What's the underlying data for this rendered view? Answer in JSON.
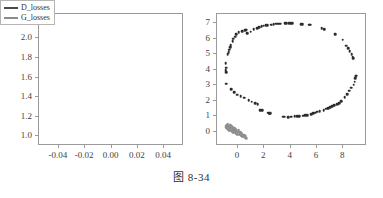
{
  "caption": "图 8-34",
  "legend": {
    "position": "upper right",
    "entries": [
      {
        "label": "D_losses",
        "color": "#4a4a4a"
      },
      {
        "label": "G_losses",
        "color": "#8c8c8c"
      }
    ]
  },
  "chart_data": [
    {
      "type": "line",
      "id": "loss-curves",
      "title": "",
      "xlabel": "",
      "ylabel": "",
      "xlim": [
        -0.055,
        0.055
      ],
      "ylim": [
        0.9,
        2.25
      ],
      "xticks": [
        "-0.04",
        "-0.02",
        "0.00",
        "0.02",
        "0.04"
      ],
      "xtick_values": [
        -0.04,
        -0.02,
        0.0,
        0.02,
        0.04
      ],
      "yticks": [
        "1.0",
        "1.2",
        "1.4",
        "1.6",
        "1.8",
        "2.0",
        "2.2"
      ],
      "ytick_values": [
        1.0,
        1.2,
        1.4,
        1.6,
        1.8,
        2.0,
        2.2
      ],
      "grid": false,
      "legend_position": "upper right",
      "series": [
        {
          "name": "D_losses",
          "color": "#4a4a4a",
          "x": [],
          "values": []
        },
        {
          "name": "G_losses",
          "color": "#8c8c8c",
          "x": [],
          "values": []
        }
      ]
    },
    {
      "type": "scatter",
      "id": "samples-scatter",
      "title": "",
      "xlabel": "",
      "ylabel": "",
      "xlim": [
        -1.6,
        9.8
      ],
      "ylim": [
        -0.9,
        7.6
      ],
      "xticks": [
        "0",
        "2",
        "4",
        "6",
        "8"
      ],
      "xtick_values": [
        0,
        2,
        4,
        6,
        8
      ],
      "yticks": [
        "0",
        "1",
        "2",
        "3",
        "4",
        "5",
        "6",
        "7"
      ],
      "ytick_values": [
        0,
        1,
        2,
        3,
        4,
        5,
        6,
        7
      ],
      "grid": false,
      "series": [
        {
          "name": "real-ring",
          "color": "#2b2b2b",
          "marker_size": 2.6,
          "points": [
            [
              -0.95,
              4.45
            ],
            [
              -0.92,
              4.15
            ],
            [
              -0.93,
              3.98
            ],
            [
              -0.9,
              3.85
            ],
            [
              -0.88,
              3.1
            ],
            [
              -0.78,
              5.0
            ],
            [
              -0.72,
              5.15
            ],
            [
              -0.66,
              5.3
            ],
            [
              -0.6,
              5.45
            ],
            [
              -0.55,
              5.6
            ],
            [
              -0.5,
              2.75
            ],
            [
              -0.42,
              5.85
            ],
            [
              -0.35,
              6.0
            ],
            [
              -0.3,
              2.55
            ],
            [
              -0.22,
              6.15
            ],
            [
              -0.14,
              6.3
            ],
            [
              -0.06,
              2.4
            ],
            [
              0.05,
              6.42
            ],
            [
              0.2,
              2.3
            ],
            [
              0.3,
              6.5
            ],
            [
              0.45,
              2.2
            ],
            [
              0.55,
              6.55
            ],
            [
              0.62,
              6.58
            ],
            [
              0.7,
              6.35
            ],
            [
              0.8,
              2.05
            ],
            [
              0.95,
              6.45
            ],
            [
              1.05,
              1.95
            ],
            [
              1.2,
              6.62
            ],
            [
              1.3,
              1.85
            ],
            [
              1.45,
              6.7
            ],
            [
              1.5,
              1.8
            ],
            [
              1.6,
              6.75
            ],
            [
              1.68,
              1.42
            ],
            [
              1.8,
              6.8
            ],
            [
              1.85,
              1.4
            ],
            [
              1.95,
              6.85
            ],
            [
              2.1,
              6.88
            ],
            [
              2.2,
              6.88
            ],
            [
              2.25,
              1.25
            ],
            [
              2.35,
              1.22
            ],
            [
              2.45,
              1.2
            ],
            [
              2.5,
              6.9
            ],
            [
              2.7,
              6.95
            ],
            [
              2.9,
              6.98
            ],
            [
              3.05,
              6.98
            ],
            [
              3.2,
              6.98
            ],
            [
              3.45,
              0.98
            ],
            [
              3.55,
              0.98
            ],
            [
              3.6,
              7.0
            ],
            [
              3.7,
              7.0
            ],
            [
              3.8,
              0.95
            ],
            [
              3.9,
              7.02
            ],
            [
              4.0,
              7.02
            ],
            [
              4.05,
              0.98
            ],
            [
              4.1,
              7.02
            ],
            [
              4.3,
              1.0
            ],
            [
              4.5,
              1.02
            ],
            [
              4.65,
              1.02
            ],
            [
              4.8,
              6.95
            ],
            [
              4.9,
              6.95
            ],
            [
              4.95,
              1.05
            ],
            [
              5.1,
              1.08
            ],
            [
              5.25,
              1.1
            ],
            [
              5.4,
              6.9
            ],
            [
              5.5,
              6.9
            ],
            [
              5.55,
              1.15
            ],
            [
              5.7,
              1.2
            ],
            [
              5.85,
              1.25
            ],
            [
              6.0,
              1.3
            ],
            [
              6.2,
              1.35
            ],
            [
              6.35,
              6.7
            ],
            [
              6.5,
              1.42
            ],
            [
              6.55,
              6.62
            ],
            [
              6.7,
              1.5
            ],
            [
              6.85,
              1.55
            ],
            [
              7.0,
              1.6
            ],
            [
              7.15,
              1.65
            ],
            [
              7.3,
              1.72
            ],
            [
              7.4,
              6.3
            ],
            [
              7.55,
              1.78
            ],
            [
              7.7,
              1.85
            ],
            [
              7.85,
              2.0
            ],
            [
              7.95,
              5.95
            ],
            [
              8.1,
              2.25
            ],
            [
              8.2,
              5.55
            ],
            [
              8.3,
              2.45
            ],
            [
              8.35,
              5.4
            ],
            [
              8.45,
              2.65
            ],
            [
              8.5,
              5.2
            ],
            [
              8.6,
              2.85
            ],
            [
              8.65,
              5.0
            ],
            [
              8.7,
              4.85
            ],
            [
              8.75,
              4.75
            ],
            [
              8.8,
              3.05
            ],
            [
              8.85,
              3.25
            ],
            [
              8.9,
              3.45
            ],
            [
              8.95,
              3.6
            ],
            [
              9.0,
              3.62
            ]
          ]
        },
        {
          "name": "generated-cluster",
          "color": "#8f8f8f",
          "marker_size": 2.6,
          "points": [
            [
              -0.92,
              0.4
            ],
            [
              -0.88,
              0.32
            ],
            [
              -0.85,
              0.45
            ],
            [
              -0.82,
              0.25
            ],
            [
              -0.8,
              0.38
            ],
            [
              -0.78,
              0.5
            ],
            [
              -0.75,
              0.18
            ],
            [
              -0.72,
              0.3
            ],
            [
              -0.7,
              0.42
            ],
            [
              -0.68,
              0.12
            ],
            [
              -0.65,
              0.26
            ],
            [
              -0.62,
              0.36
            ],
            [
              -0.6,
              0.46
            ],
            [
              -0.58,
              0.08
            ],
            [
              -0.55,
              0.2
            ],
            [
              -0.52,
              0.3
            ],
            [
              -0.5,
              0.4
            ],
            [
              -0.48,
              0.05
            ],
            [
              -0.45,
              0.15
            ],
            [
              -0.42,
              0.25
            ],
            [
              -0.4,
              0.34
            ],
            [
              -0.38,
              0.0
            ],
            [
              -0.35,
              0.1
            ],
            [
              -0.32,
              0.2
            ],
            [
              -0.3,
              0.28
            ],
            [
              -0.28,
              -0.05
            ],
            [
              -0.25,
              0.05
            ],
            [
              -0.22,
              0.14
            ],
            [
              -0.2,
              0.22
            ],
            [
              -0.18,
              -0.1
            ],
            [
              -0.15,
              0.0
            ],
            [
              -0.12,
              0.08
            ],
            [
              -0.1,
              0.16
            ],
            [
              -0.05,
              -0.14
            ],
            [
              -0.02,
              -0.05
            ],
            [
              0.0,
              0.02
            ],
            [
              0.04,
              0.1
            ],
            [
              0.08,
              -0.18
            ],
            [
              0.12,
              -0.1
            ],
            [
              0.16,
              -0.02
            ],
            [
              0.2,
              -0.22
            ],
            [
              0.24,
              -0.14
            ],
            [
              0.28,
              -0.06
            ],
            [
              0.32,
              -0.26
            ],
            [
              0.36,
              -0.18
            ],
            [
              0.4,
              -0.3
            ],
            [
              0.45,
              -0.22
            ],
            [
              0.5,
              -0.34
            ],
            [
              0.55,
              -0.28
            ],
            [
              0.6,
              -0.38
            ]
          ]
        }
      ]
    }
  ]
}
